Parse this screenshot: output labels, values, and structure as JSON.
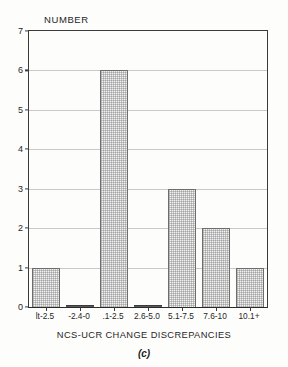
{
  "chart_data": {
    "type": "bar",
    "title": "",
    "subtitle": "",
    "ylabel": "NUMBER",
    "xlabel": "NCS-UCR CHANGE DISCREPANCIES",
    "panel_label": "(c)",
    "categories": [
      "lt-2.5",
      "-2.4-0",
      ".1-2.5",
      "2.6-5.0",
      "5.1-7.5",
      "7.6-10",
      "10.1+"
    ],
    "values": [
      1,
      0,
      6,
      0,
      3,
      2,
      1
    ],
    "ylim": [
      0,
      7
    ],
    "ytick_labels": [
      "0",
      "1",
      "2",
      "3",
      "4",
      "5",
      "6",
      "7"
    ],
    "ytick_values": [
      0,
      1,
      2,
      3,
      4,
      5,
      6,
      7
    ],
    "grid": true,
    "grid_axis": "y",
    "legend": false,
    "legend_position": "none",
    "bar_fill_color": "#f2f2f2",
    "bar_edge_color": "#6d6d6d",
    "axis_color": "#3b3b3b",
    "grid_color": "#c9c9c9",
    "background_color": "#fdfdfc"
  }
}
